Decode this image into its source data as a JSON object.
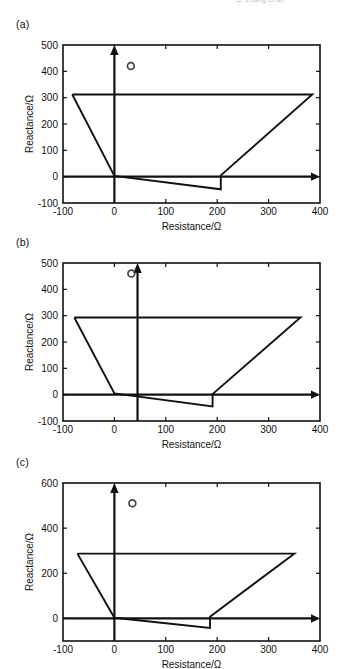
{
  "page": {
    "header_faint_text": "S. Zhang et al.",
    "axis_labels": {
      "x": "Resistance/Ω",
      "y": "Reactance/Ω"
    },
    "line_color": "#111111",
    "marker_color": "#444444",
    "background": "#ffffff"
  },
  "chart_data": [
    {
      "id": "panel-a",
      "type": "line",
      "title": "(a)",
      "xlabel": "Resistance/Ω",
      "ylabel": "Reactance/Ω",
      "xlim": [
        -100,
        400
      ],
      "ylim": [
        -100,
        500
      ],
      "xticks": [
        -100,
        0,
        100,
        200,
        300,
        400
      ],
      "yticks": [
        -100,
        0,
        100,
        200,
        300,
        400,
        500
      ],
      "grid": false,
      "legend": "none",
      "axis_arrows": {
        "vertical_at_x": 0,
        "horizontal_at_y": 0
      },
      "marker": {
        "shape": "circle",
        "x": 32,
        "y": 420,
        "label": "operating point"
      },
      "locus": {
        "name": "impedance locus",
        "points": [
          [
            -82,
            312
          ],
          [
            385,
            312
          ],
          [
            207,
            5
          ],
          [
            207,
            -48
          ],
          [
            0,
            3
          ],
          [
            -82,
            312
          ]
        ]
      },
      "segments": [
        {
          "name": "upper-horizontal",
          "from": [
            -82,
            312
          ],
          "to": [
            385,
            312
          ]
        },
        {
          "name": "right-diagonal",
          "from": [
            385,
            312
          ],
          "to": [
            207,
            5
          ]
        },
        {
          "name": "notch-vertical",
          "from": [
            207,
            5
          ],
          "to": [
            207,
            -48
          ]
        },
        {
          "name": "lower-slope",
          "from": [
            207,
            -48
          ],
          "to": [
            0,
            3
          ]
        },
        {
          "name": "left-diagonal",
          "from": [
            0,
            3
          ],
          "to": [
            -82,
            312
          ]
        }
      ]
    },
    {
      "id": "panel-b",
      "type": "line",
      "title": "(b)",
      "xlabel": "Resistance/Ω",
      "ylabel": "Reactance/Ω",
      "xlim": [
        -100,
        400
      ],
      "ylim": [
        -100,
        500
      ],
      "xticks": [
        -100,
        0,
        100,
        200,
        300,
        400
      ],
      "yticks": [
        -100,
        0,
        100,
        200,
        300,
        400,
        500
      ],
      "grid": false,
      "legend": "none",
      "axis_arrows": {
        "vertical_at_x": 45,
        "horizontal_at_y": 0
      },
      "marker": {
        "shape": "circle",
        "x": 33,
        "y": 460,
        "label": "operating point"
      },
      "locus": {
        "name": "impedance locus",
        "points": [
          [
            -78,
            293
          ],
          [
            362,
            293
          ],
          [
            191,
            2
          ],
          [
            191,
            -45
          ],
          [
            0,
            5
          ],
          [
            -78,
            293
          ]
        ]
      },
      "segments": [
        {
          "name": "upper-horizontal",
          "from": [
            -78,
            293
          ],
          "to": [
            362,
            293
          ]
        },
        {
          "name": "right-diagonal",
          "from": [
            362,
            293
          ],
          "to": [
            191,
            2
          ]
        },
        {
          "name": "notch-vertical",
          "from": [
            191,
            2
          ],
          "to": [
            191,
            -45
          ]
        },
        {
          "name": "lower-slope",
          "from": [
            191,
            -45
          ],
          "to": [
            0,
            5
          ]
        },
        {
          "name": "left-diagonal",
          "from": [
            0,
            5
          ],
          "to": [
            -78,
            293
          ]
        }
      ]
    },
    {
      "id": "panel-c",
      "type": "line",
      "title": "(c)",
      "xlabel": "Resistance/Ω",
      "ylabel": "Reactance/Ω",
      "xlim": [
        -100,
        400
      ],
      "ylim": [
        -100,
        600
      ],
      "xticks": [
        -100,
        0,
        100,
        200,
        300,
        400
      ],
      "yticks": [
        0,
        200,
        400,
        600
      ],
      "grid": false,
      "legend": "none",
      "axis_arrows": {
        "vertical_at_x": 0,
        "horizontal_at_y": 0
      },
      "marker": {
        "shape": "circle",
        "x": 35,
        "y": 510,
        "label": "operating point"
      },
      "locus": {
        "name": "impedance locus",
        "points": [
          [
            -72,
            287
          ],
          [
            350,
            287
          ],
          [
            186,
            8
          ],
          [
            186,
            -42
          ],
          [
            0,
            3
          ],
          [
            -72,
            287
          ]
        ]
      },
      "segments": [
        {
          "name": "upper-horizontal",
          "from": [
            -72,
            287
          ],
          "to": [
            350,
            287
          ]
        },
        {
          "name": "right-diagonal",
          "from": [
            350,
            287
          ],
          "to": [
            186,
            8
          ]
        },
        {
          "name": "notch-vertical",
          "from": [
            186,
            8
          ],
          "to": [
            186,
            -42
          ]
        },
        {
          "name": "lower-slope",
          "from": [
            186,
            -42
          ],
          "to": [
            0,
            3
          ]
        },
        {
          "name": "left-diagonal",
          "from": [
            0,
            3
          ],
          "to": [
            -72,
            287
          ]
        }
      ]
    }
  ]
}
